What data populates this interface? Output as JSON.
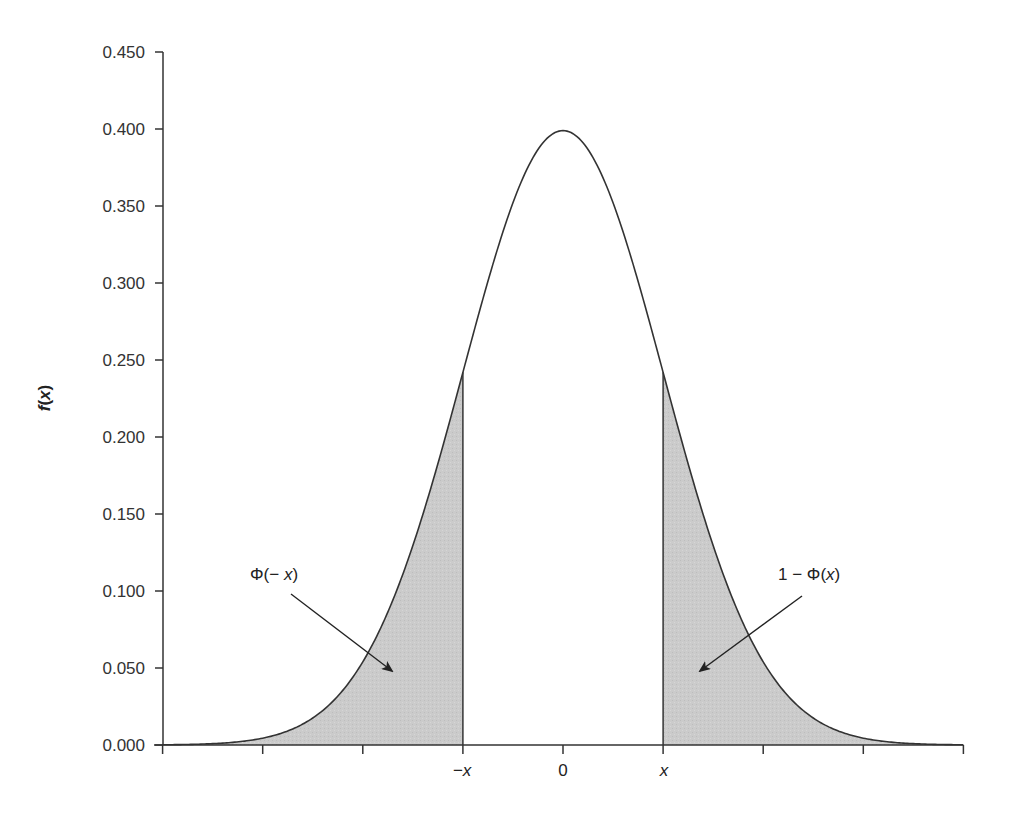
{
  "chart_data": {
    "type": "area",
    "title": "",
    "subtitle": "",
    "xlabel": "",
    "ylabel": "f(x)",
    "ylim": [
      0,
      0.45
    ],
    "xlim": [
      -4,
      4
    ],
    "grid": false,
    "legend": null,
    "y_ticks": [
      "0.000",
      "0.050",
      "0.100",
      "0.150",
      "0.200",
      "0.250",
      "0.300",
      "0.350",
      "0.400",
      "0.450"
    ],
    "x_ticks": [
      -4,
      -3,
      -2,
      -1,
      0,
      1,
      2,
      3,
      4
    ],
    "x_tick_labels": [
      {
        "at": -1,
        "label": "−x"
      },
      {
        "at": 0,
        "label": "0"
      },
      {
        "at": 1,
        "label": "x"
      }
    ],
    "series": [
      {
        "name": "standard normal density",
        "function": "f(x) = exp(-x^2/2)/sqrt(2*pi)",
        "peak": {
          "x": 0,
          "y": 0.399
        },
        "x": [
          -4,
          -3.5,
          -3,
          -2.5,
          -2,
          -1.5,
          -1,
          -0.5,
          0,
          0.5,
          1,
          1.5,
          2,
          2.5,
          3,
          3.5,
          4
        ],
        "values": [
          0.0001,
          0.0009,
          0.0044,
          0.0175,
          0.054,
          0.1295,
          0.242,
          0.3521,
          0.3989,
          0.3521,
          0.242,
          0.1295,
          0.054,
          0.0175,
          0.0044,
          0.0009,
          0.0001
        ]
      }
    ],
    "shaded_regions": [
      {
        "name": "left tail",
        "from": -4,
        "to": -1,
        "fill": "#c8c8c8",
        "label": "Φ(− x)"
      },
      {
        "name": "right tail",
        "from": 1,
        "to": 4,
        "fill": "#c8c8c8",
        "label": "1 − Φ(x)"
      }
    ],
    "annotations": [
      {
        "text": "Φ(− x)",
        "points_to": "left tail"
      },
      {
        "text": "1 − Φ(x)",
        "points_to": "right tail"
      }
    ]
  },
  "colors": {
    "line": "#333333",
    "shade": "#c9c9c9",
    "text": "#333333"
  },
  "labels": {
    "ylabel_f": "f",
    "ylabel_open": "(",
    "ylabel_x": "x",
    "ylabel_close": ")",
    "x_neg": "−x",
    "x_zero": "0",
    "x_pos": "x",
    "annot_left_phi": "Φ(− ",
    "annot_left_x": "x",
    "annot_left_close": ")",
    "annot_right_prefix": "1 − Φ(",
    "annot_right_x": "x",
    "annot_right_close": ")"
  }
}
